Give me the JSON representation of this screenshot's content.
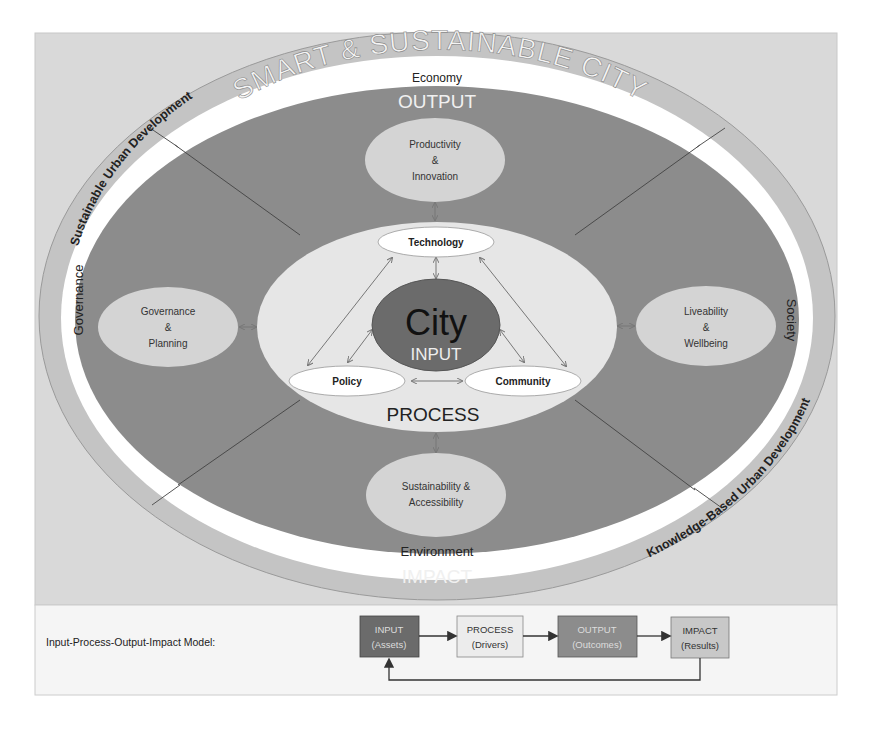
{
  "title": "SMART & SUSTAINABLE CITY",
  "outer_ring": {
    "left_label": "Sustainable Urban Development",
    "right_label": "Knowledge-Based Urban Development"
  },
  "domains": {
    "top": "Economy",
    "left": "Governance",
    "right": "Society",
    "bottom": "Environment"
  },
  "layers": {
    "output": "OUTPUT",
    "impact": "IMPACT",
    "process": "PROCESS",
    "input": "INPUT",
    "core": "City"
  },
  "outcome_nodes": {
    "top": [
      "Productivity",
      "&",
      "Innovation"
    ],
    "left": [
      "Governance",
      "&",
      "Planning"
    ],
    "right": [
      "Liveability",
      "&",
      "Wellbeing"
    ],
    "bottom": [
      "Sustainability &",
      "Accessibility"
    ]
  },
  "driver_nodes": {
    "technology": "Technology",
    "policy": "Policy",
    "community": "Community"
  },
  "legend": {
    "label": "Input-Process-Output-Impact Model:",
    "boxes": [
      {
        "title": "INPUT",
        "subtitle": "(Assets)"
      },
      {
        "title": "PROCESS",
        "subtitle": "(Drivers)"
      },
      {
        "title": "OUTPUT",
        "subtitle": "(Outcomes)"
      },
      {
        "title": "IMPACT",
        "subtitle": "(Results)"
      }
    ]
  },
  "colors": {
    "frame_bg": "#d9d9d9",
    "outer_ring": "#c4c4c4",
    "white_ring": "#ffffff",
    "output_area": "#8c8c8c",
    "outcome_node": "#d4d4d4",
    "process_area": "#e6e6e6",
    "city_core": "#6b6b6b",
    "driver_node": "#ffffff",
    "legend_bg": "#f5f5f5",
    "legend_input": "#6b6b6b",
    "legend_process": "#ececec",
    "legend_output": "#8c8c8c",
    "legend_impact": "#c8c8c8"
  }
}
